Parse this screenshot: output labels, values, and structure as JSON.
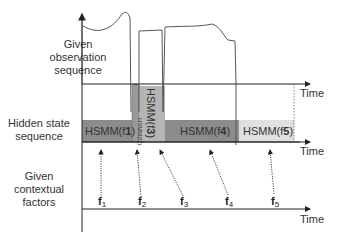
{
  "labels": {
    "observation": [
      "Given",
      "observation",
      "sequence"
    ],
    "hidden": [
      "Hidden state",
      "sequence"
    ],
    "context": [
      "Given",
      "contextual",
      "factors"
    ]
  },
  "axes": {
    "time_label": "Time"
  },
  "segments": [
    {
      "id": "seg1",
      "label": "HSMM(f",
      "sub": "1",
      "color": "#8c8c8c",
      "orientation": "horizontal"
    },
    {
      "id": "seg2",
      "label": "HSMM(f",
      "sub": "2",
      "color": "#9a9a9a",
      "orientation": "vertical"
    },
    {
      "id": "seg3",
      "label": "HSMM(f",
      "sub": "3",
      "color": "#b5b5b5",
      "orientation": "vertical"
    },
    {
      "id": "seg4",
      "label": "HSMM(f",
      "sub": "4",
      "color": "#8c8c8c",
      "orientation": "horizontal"
    },
    {
      "id": "seg5",
      "label": "HSMM(f",
      "sub": "5",
      "color": "#e0e0e0",
      "orientation": "horizontal"
    }
  ],
  "factors": [
    {
      "label": "f",
      "sub": "1"
    },
    {
      "label": "f",
      "sub": "2"
    },
    {
      "label": "f",
      "sub": "3"
    },
    {
      "label": "f",
      "sub": "4"
    },
    {
      "label": "f",
      "sub": "5"
    }
  ]
}
